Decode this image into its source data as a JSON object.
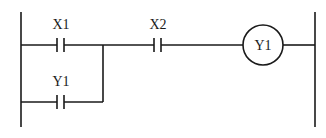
{
  "diagram": {
    "type": "ladder-logic",
    "colors": {
      "line": "#1a1a1a",
      "background": "#ffffff"
    },
    "rails": {
      "left": {
        "x": 21,
        "y1": 12,
        "y2": 127
      },
      "right": {
        "x": 315,
        "y1": 12,
        "y2": 127
      }
    },
    "rungs": [
      {
        "id": "rung-1",
        "y": 45,
        "elements": [
          {
            "kind": "contact-no",
            "label": "X1",
            "x": 60
          },
          {
            "kind": "contact-no",
            "label": "X2",
            "x": 157
          },
          {
            "kind": "coil",
            "label": "Y1",
            "cx": 263,
            "r": 20
          }
        ]
      },
      {
        "id": "rung-1-branch",
        "y": 102,
        "parallel_to": "X1",
        "branch_join_x": 103,
        "elements": [
          {
            "kind": "contact-no",
            "label": "Y1",
            "x": 60
          }
        ]
      }
    ]
  },
  "labels": {
    "x1": "X1",
    "x2": "X2",
    "y1_contact": "Y1",
    "y1_coil": "Y1"
  }
}
